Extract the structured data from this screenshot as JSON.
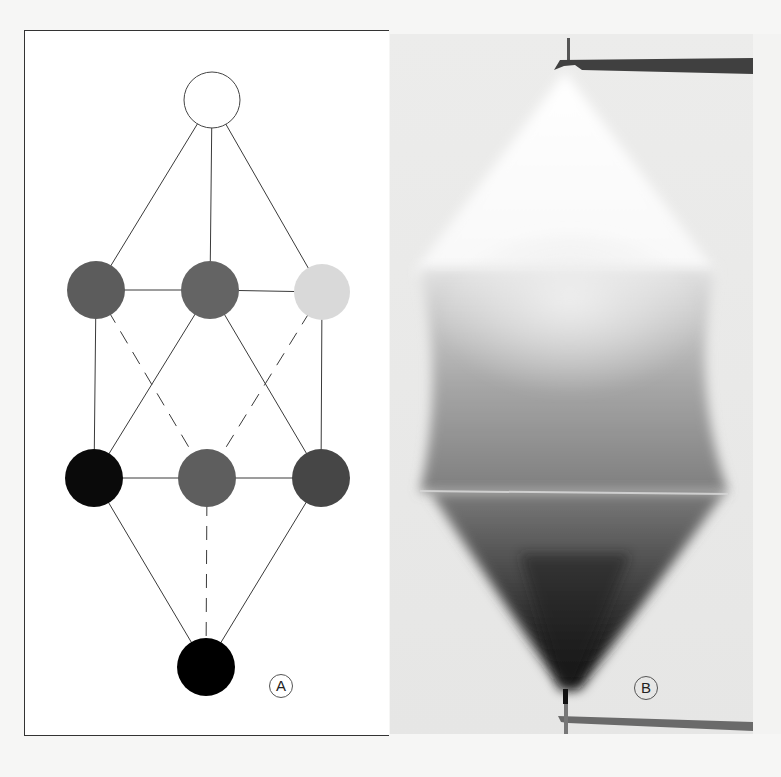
{
  "figure": {
    "panels": [
      {
        "id": "A",
        "label": "A",
        "type": "lattice-diagram",
        "nodes": [
          {
            "id": "top",
            "cx": 187,
            "cy": 69,
            "r": 28,
            "fill": "#ffffff",
            "stroke": "#444444"
          },
          {
            "id": "mid-left",
            "cx": 71,
            "cy": 259,
            "r": 29,
            "fill": "#5c5c5c"
          },
          {
            "id": "mid-center",
            "cx": 185,
            "cy": 259,
            "r": 29,
            "fill": "#646464"
          },
          {
            "id": "mid-right",
            "cx": 297,
            "cy": 261,
            "r": 28,
            "fill": "#d9d9d9"
          },
          {
            "id": "low-left",
            "cx": 69,
            "cy": 447,
            "r": 29,
            "fill": "#0a0a0a"
          },
          {
            "id": "low-center",
            "cx": 182,
            "cy": 447,
            "r": 29,
            "fill": "#5e5e5e"
          },
          {
            "id": "low-right",
            "cx": 296,
            "cy": 447,
            "r": 29,
            "fill": "#464646"
          },
          {
            "id": "bottom",
            "cx": 181,
            "cy": 636,
            "r": 29,
            "fill": "#000000"
          }
        ],
        "edges": [
          {
            "from": "top",
            "to": "mid-left",
            "style": "solid"
          },
          {
            "from": "top",
            "to": "mid-center",
            "style": "solid"
          },
          {
            "from": "top",
            "to": "mid-right",
            "style": "solid"
          },
          {
            "from": "mid-left",
            "to": "mid-center",
            "style": "solid"
          },
          {
            "from": "mid-center",
            "to": "mid-right",
            "style": "solid"
          },
          {
            "from": "mid-left",
            "to": "low-left",
            "style": "solid"
          },
          {
            "from": "mid-right",
            "to": "low-right",
            "style": "solid"
          },
          {
            "from": "mid-center",
            "to": "low-left",
            "style": "solid"
          },
          {
            "from": "mid-center",
            "to": "low-right",
            "style": "solid"
          },
          {
            "from": "mid-left",
            "to": "low-center",
            "style": "dashed"
          },
          {
            "from": "mid-right",
            "to": "low-center",
            "style": "dashed"
          },
          {
            "from": "low-left",
            "to": "low-center",
            "style": "solid"
          },
          {
            "from": "low-center",
            "to": "low-right",
            "style": "solid"
          },
          {
            "from": "low-left",
            "to": "bottom",
            "style": "solid"
          },
          {
            "from": "low-right",
            "to": "bottom",
            "style": "solid"
          },
          {
            "from": "low-center",
            "to": "bottom",
            "style": "dashed"
          }
        ]
      },
      {
        "id": "B",
        "label": "B",
        "type": "photograph",
        "description": "Gradient shaded spindle/cone form between two horizontal rods, light at top, dark at bottom apex"
      }
    ]
  }
}
